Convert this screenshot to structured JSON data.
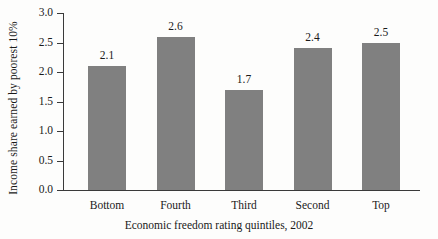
{
  "chart_data": {
    "type": "bar",
    "title": "",
    "subtitle": "",
    "categories": [
      "Bottom",
      "Fourth",
      "Third",
      "Second",
      "Top"
    ],
    "values": [
      2.1,
      2.6,
      1.7,
      2.4,
      2.5
    ],
    "value_labels": [
      "2.1",
      "2.6",
      "1.7",
      "2.4",
      "2.5"
    ],
    "xlabel": "Economic freedom rating quintiles, 2002",
    "ylabel": "Income share earned by poorest 10%",
    "ylim": [
      0.0,
      3.0
    ],
    "ytick_values": [
      0.0,
      0.5,
      1.0,
      1.5,
      2.0,
      2.5,
      3.0
    ],
    "ytick_labels": [
      "0.0",
      "0.5",
      "1.0",
      "1.5",
      "2.0",
      "2.5",
      "3.0"
    ],
    "grid": false,
    "legend": null,
    "bar_color": "#808080",
    "axis_color": "#3a3a3a",
    "background_color": "#fdfdfc",
    "annotations": []
  }
}
